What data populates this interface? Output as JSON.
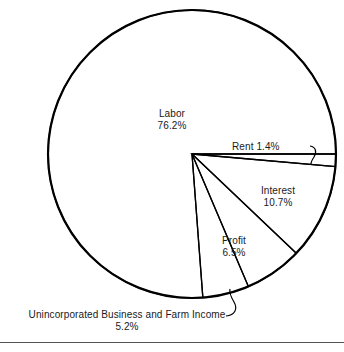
{
  "figure": {
    "background_color": "#ffffff",
    "stroke_color": "#000000",
    "text_color": "#1a1a1a",
    "rule_color": "#555555"
  },
  "chart_data": {
    "type": "pie",
    "title": "",
    "subtitle": "",
    "xlabel": "",
    "ylabel": "",
    "legend_position": "none",
    "grid": false,
    "units": "percent",
    "start_angle_deg": 0,
    "direction": "clockwise",
    "center": {
      "x": 192,
      "y": 154
    },
    "radius": 144,
    "labels": [
      "Rent",
      "Interest",
      "Profit",
      "Unincorporated Business and Farm Income",
      "Labor"
    ],
    "values": [
      1.4,
      10.7,
      6.5,
      5.2,
      76.2
    ],
    "slices": [
      {
        "name": "Rent",
        "value": 1.4,
        "value_text": "1.4%",
        "label_text": "Rent 1.4%",
        "label_placement": "outside",
        "leader_line": true
      },
      {
        "name": "Interest",
        "value": 10.7,
        "value_text": "10.7%",
        "label_text": "Interest",
        "label_placement": "inside",
        "leader_line": false
      },
      {
        "name": "Profit",
        "value": 6.5,
        "value_text": "6.5%",
        "label_text": "Profit",
        "label_placement": "inside",
        "leader_line": false
      },
      {
        "name": "Unincorporated Business and Farm Income",
        "value": 5.2,
        "value_text": "5.2%",
        "label_text": "Unincorporated Business and Farm Income",
        "label_placement": "outside",
        "leader_line": true
      },
      {
        "name": "Labor",
        "value": 76.2,
        "value_text": "76.2%",
        "label_text": "Labor",
        "label_placement": "inside",
        "leader_line": false
      }
    ]
  },
  "labels": {
    "labor": {
      "name": "Labor",
      "value": "76.2%"
    },
    "rent": {
      "name": "Rent",
      "value": "1.4%"
    },
    "interest": {
      "name": "Interest",
      "value": "10.7%"
    },
    "profit": {
      "name": "Profit",
      "value": "6.5%"
    },
    "unincorporated": {
      "name": "Unincorporated Business and Farm Income",
      "value": "5.2%"
    }
  }
}
